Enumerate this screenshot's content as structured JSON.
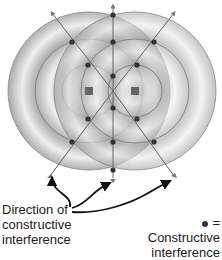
{
  "diagram": {
    "type": "two-source wave interference pattern",
    "sources": [
      {
        "name": "left-source",
        "x": 89,
        "y": 91
      },
      {
        "name": "right-source",
        "x": 135,
        "y": 91
      }
    ],
    "ring_radii": [
      27,
      54,
      81
    ],
    "constructive_points": [
      {
        "x": 113,
        "y": 15
      },
      {
        "x": 72,
        "y": 42
      },
      {
        "x": 113,
        "y": 42
      },
      {
        "x": 154,
        "y": 42
      },
      {
        "x": 88,
        "y": 65
      },
      {
        "x": 137,
        "y": 65
      },
      {
        "x": 113,
        "y": 76
      },
      {
        "x": 113,
        "y": 108
      },
      {
        "x": 88,
        "y": 119
      },
      {
        "x": 137,
        "y": 119
      },
      {
        "x": 72,
        "y": 142
      },
      {
        "x": 113,
        "y": 142
      },
      {
        "x": 154,
        "y": 142
      },
      {
        "x": 113,
        "y": 170
      }
    ],
    "colors": {
      "ring_light": "#f2f2f2",
      "ring_dark": "#9a9a9a",
      "line": "#555555",
      "dot": "#333333",
      "source": "#666666"
    }
  },
  "labels": {
    "direction_line1": "Direction of",
    "direction_line2": "constructive",
    "direction_line3": "interference",
    "legend_symbol": "= Constructive",
    "legend_line2": "interference"
  }
}
